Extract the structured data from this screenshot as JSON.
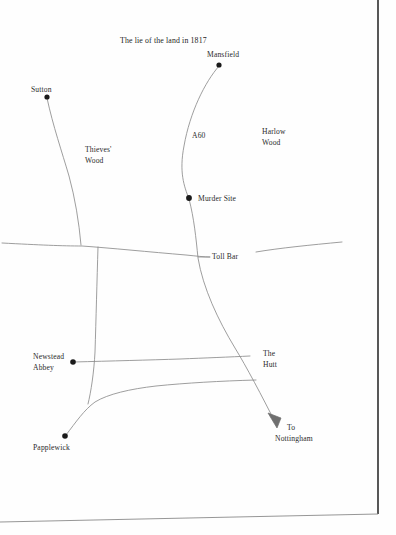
{
  "map": {
    "title": "The lie of the land in 1817",
    "background_color": "#fefefe",
    "road_color": "#8d8d8d",
    "border_color": "#3a3a3a",
    "marker_color": "#1a1a1a",
    "text_color": "#2a2a2a",
    "places": [
      {
        "id": "mansfield",
        "label": "Mansfield",
        "has_marker": true,
        "x": 219,
        "y": 65
      },
      {
        "id": "sutton",
        "label": "Sutton",
        "has_marker": true,
        "x": 47,
        "y": 97
      },
      {
        "id": "murder-site",
        "label": "Murder Site",
        "has_marker": true,
        "x": 189,
        "y": 198
      },
      {
        "id": "newstead-abbey",
        "label": "Newstead Abbey",
        "line1": "Newstead",
        "line2": "Abbey",
        "has_marker": true,
        "x": 73,
        "y": 362
      },
      {
        "id": "papplewick",
        "label": "Papplewick",
        "has_marker": true,
        "x": 65,
        "y": 436
      }
    ],
    "areas": [
      {
        "id": "thieves-wood",
        "label": "Thieves' Wood",
        "line1": "Thieves'",
        "line2": "Wood"
      },
      {
        "id": "harlow-wood",
        "label": "Harlow Wood",
        "line1": "Harlow",
        "line2": "Wood"
      },
      {
        "id": "the-hutt",
        "label": "The Hutt",
        "line1": "The",
        "line2": "Hutt"
      }
    ],
    "roads": [
      {
        "id": "a60",
        "label": "A60"
      },
      {
        "id": "toll-bar",
        "label": "Toll Bar"
      }
    ],
    "direction": {
      "id": "to-nottingham",
      "label": "To Nottingham",
      "line1": "To",
      "line2": "Nottingham"
    }
  }
}
